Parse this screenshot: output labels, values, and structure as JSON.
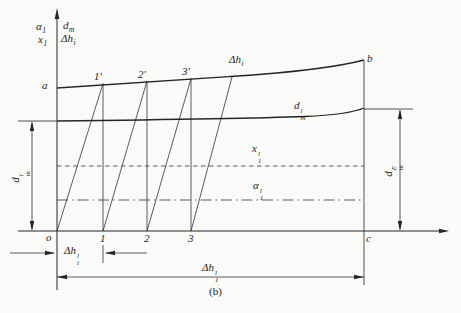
{
  "figure": {
    "caption": "(b)",
    "type": "construction-diagram",
    "colors": {
      "ink": "#262626",
      "paper": "#fafaf8"
    }
  },
  "labels": {
    "alpha1": {
      "base": "α",
      "sub": "1"
    },
    "x1": {
      "base": "x",
      "sub": "1"
    },
    "dm_axis": {
      "base": "d",
      "sub": "m"
    },
    "dhi_axis": {
      "base": "Δh",
      "sub": "i"
    },
    "dhi_curve": {
      "base": "Δh",
      "sub": "i"
    },
    "dm_curve": {
      "base": "d",
      "sub": "m",
      "sup": "l"
    },
    "x1l": {
      "base": "x",
      "sub": "1",
      "sup": "l"
    },
    "alpha1l": {
      "base": "α",
      "sub": "1",
      "sup": "l"
    },
    "dim_dm_left": {
      "base": "d",
      "sub": "m",
      "sup": "l"
    },
    "dim_dm_right": {
      "base": "d",
      "sub": "m",
      "sup": "E"
    },
    "dim_dhi": {
      "base": "Δh",
      "sub": "i",
      "sup": "l"
    },
    "dim_dh_total": {
      "base": "Δh",
      "sub": "1",
      "sup": "l"
    },
    "pt_a": "a",
    "pt_b": "b",
    "pt_o": "o",
    "pt_c": "c",
    "p1_prime": "1′",
    "p2_prime": "2′",
    "p3_prime": "3′",
    "n1": "1",
    "n2": "2",
    "n3": "3",
    "caption": "(b)"
  }
}
